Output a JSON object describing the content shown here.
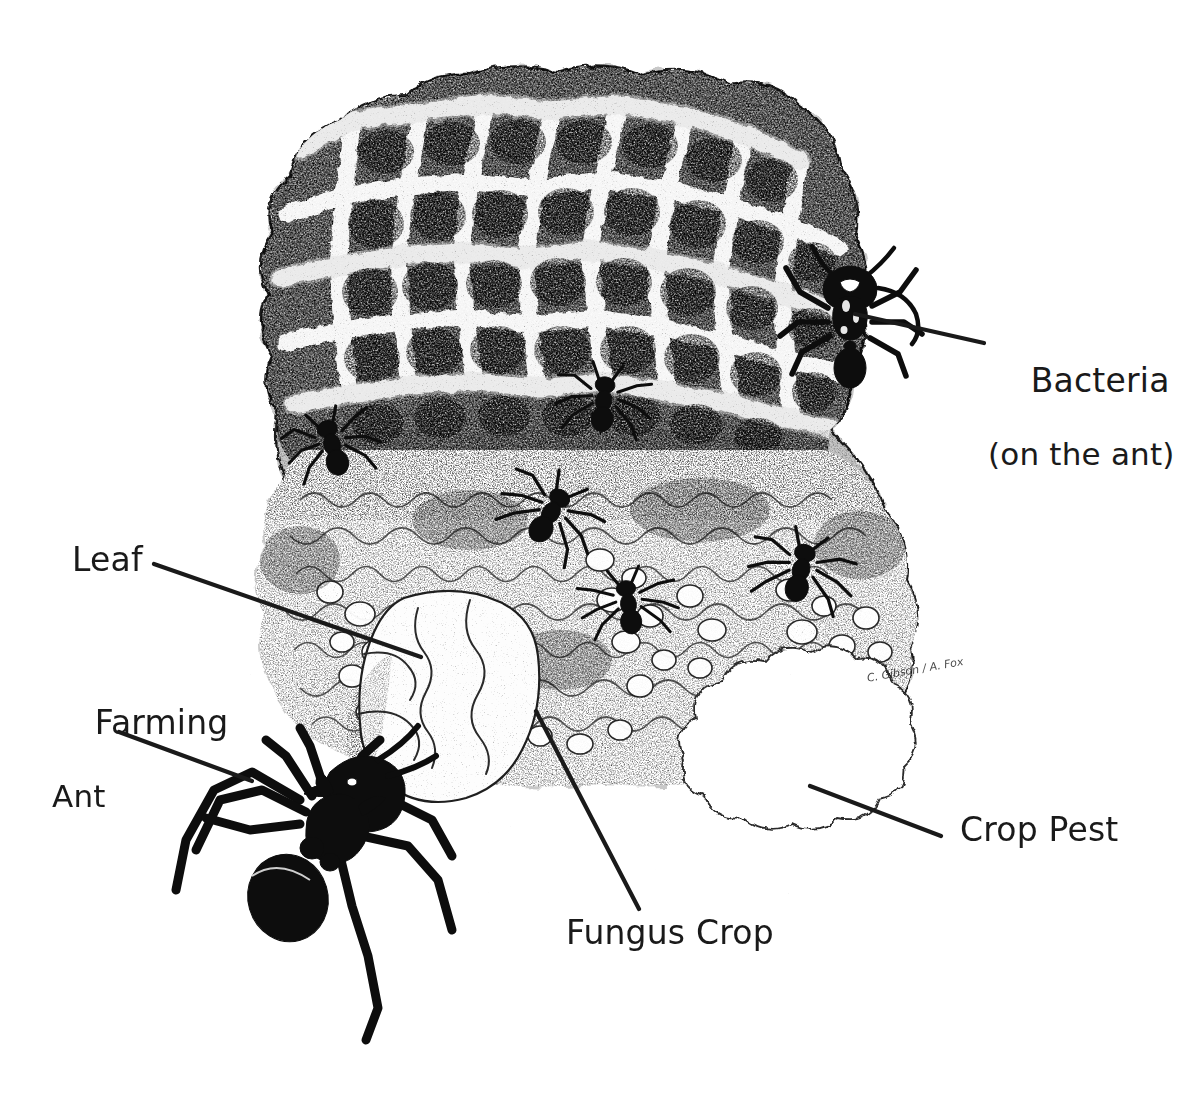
{
  "figure": {
    "medium": "pen-and-ink stipple illustration",
    "background_color": "#ffffff",
    "ink_color": "#1a1a1a",
    "width": 1199,
    "height": 1096
  },
  "labels": {
    "bacteria": {
      "line1": "Bacteria",
      "line2": "(on the ant)"
    },
    "leaf": "Leaf",
    "farming_ant_line1": "Farming",
    "farming_ant_line2": "Ant",
    "fungus_crop": "Fungus Crop",
    "crop_pest": "Crop Pest"
  },
  "signature": "C. Gibson / A. Fox",
  "leader_lines": [
    {
      "name": "bacteria",
      "x1": 855,
      "y1": 314,
      "x2": 984,
      "y2": 343
    },
    {
      "name": "leaf",
      "x1": 154,
      "y1": 564,
      "x2": 421,
      "y2": 657
    },
    {
      "name": "farming-ant",
      "x1": 119,
      "y1": 732,
      "x2": 252,
      "y2": 781
    },
    {
      "name": "fungus-crop",
      "x1": 639,
      "y1": 909,
      "x2": 536,
      "y2": 711
    },
    {
      "name": "crop-pest",
      "x1": 810,
      "y1": 786,
      "x2": 941,
      "y2": 836
    }
  ],
  "subjects": [
    {
      "name": "fungus-garden",
      "description": "large reticulated honeycomb fungus garden mass"
    },
    {
      "name": "farming-ant",
      "description": "large foreground leafcutter ant carrying a leaf fragment"
    },
    {
      "name": "leaf-fragment",
      "description": "pale cut leaf piece held above the ant"
    },
    {
      "name": "bacteria-ant",
      "description": "ant viewed from above at upper right, host to bacteria"
    },
    {
      "name": "crop-pest",
      "description": "pale lobed fungal pathogen blob at lower right"
    },
    {
      "name": "worker-ant",
      "description": "small worker ants tending the garden surface"
    }
  ]
}
